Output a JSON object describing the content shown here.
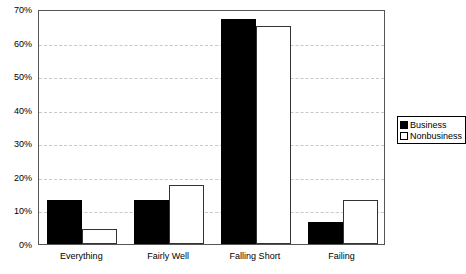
{
  "chart_data": {
    "type": "bar",
    "title": "",
    "subtitle": "",
    "xlabel": "",
    "ylabel": "",
    "categories": [
      "Everything",
      "Fairly Well",
      "Falling Short",
      "Failing"
    ],
    "series": [
      {
        "name": "Business",
        "color": "#000000",
        "values": [
          13,
          13,
          67,
          6.5
        ]
      },
      {
        "name": "Nonbusiness",
        "color": "#ffffff",
        "values": [
          4.5,
          17.5,
          65,
          13
        ]
      }
    ],
    "ylim": [
      0,
      70
    ],
    "ytick_values": [
      0,
      10,
      20,
      30,
      40,
      50,
      60,
      70
    ],
    "ytick_labels": [
      "0%",
      "10%",
      "20%",
      "30%",
      "40%",
      "50%",
      "60%",
      "70%"
    ],
    "grid": true,
    "grid_axis": "y",
    "grid_style": "dashed",
    "grid_color": "#c8c8c8",
    "legend_position": "right",
    "legend_entries": [
      "Business",
      "Nonbusiness"
    ],
    "plot_border_color": "#555555",
    "background_color": "#ffffff"
  }
}
